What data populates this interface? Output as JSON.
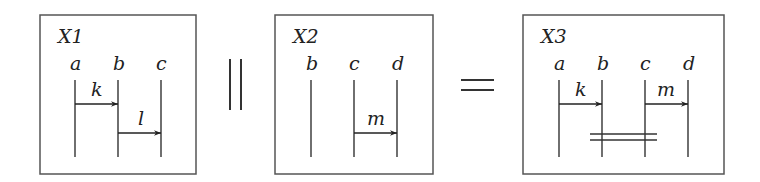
{
  "diagram": {
    "operator_parallel": "||",
    "operator_equals": "=",
    "boxes": [
      {
        "title": "X1",
        "wires": [
          {
            "label": "a"
          },
          {
            "label": "b"
          },
          {
            "label": "c"
          }
        ],
        "arrows": [
          {
            "label": "k",
            "from": "a",
            "to": "b"
          },
          {
            "label": "l",
            "from": "b",
            "to": "c"
          }
        ]
      },
      {
        "title": "X2",
        "wires": [
          {
            "label": "b"
          },
          {
            "label": "c"
          },
          {
            "label": "d"
          }
        ],
        "arrows": [
          {
            "label": "m",
            "from": "c",
            "to": "d"
          }
        ]
      },
      {
        "title": "X3",
        "wires": [
          {
            "label": "a"
          },
          {
            "label": "b"
          },
          {
            "label": "c"
          },
          {
            "label": "d"
          }
        ],
        "arrows": [
          {
            "label": "k",
            "from": "a",
            "to": "b"
          },
          {
            "label": "m",
            "from": "c",
            "to": "d"
          }
        ],
        "parallel_bar": {
          "between": [
            "b",
            "c"
          ]
        }
      }
    ]
  },
  "colors": {
    "stroke": "#333333",
    "box": "#555555",
    "text": "#222222"
  }
}
